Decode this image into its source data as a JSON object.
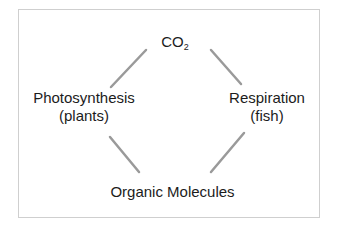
{
  "diagram": {
    "type": "cycle",
    "nodes": {
      "top": {
        "label": "CO",
        "subscript": "2"
      },
      "left": {
        "line1": "Photosynthesis",
        "line2": "(plants)"
      },
      "right": {
        "line1": "Respiration",
        "line2": "(fish)"
      },
      "bottom": {
        "label": "Organic Molecules"
      }
    },
    "edges": [
      {
        "from": "top",
        "to": "left"
      },
      {
        "from": "top",
        "to": "right"
      },
      {
        "from": "left",
        "to": "bottom"
      },
      {
        "from": "right",
        "to": "bottom"
      }
    ],
    "colors": {
      "connector": "#9a9a9a",
      "text": "#1c1c1c",
      "frame": "#cfcfcf"
    }
  }
}
